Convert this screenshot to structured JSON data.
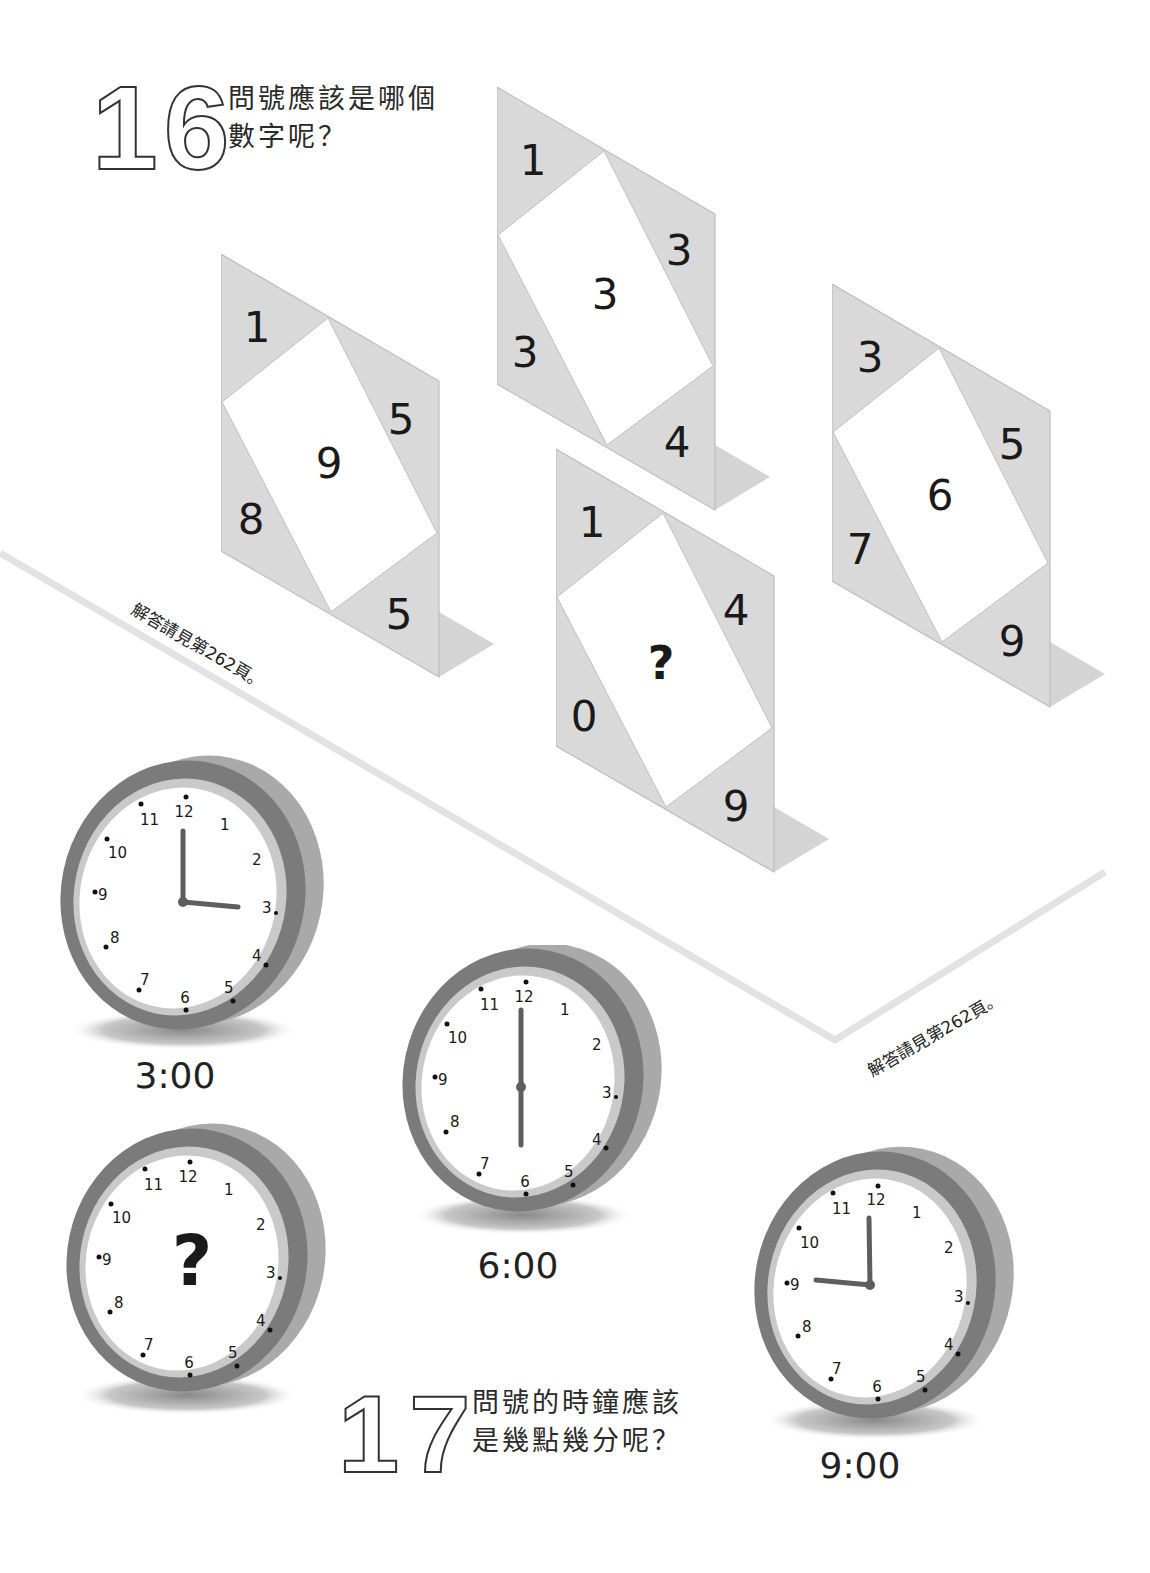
{
  "puzzle16": {
    "number": "16",
    "question_line1": "問號應該是哪個",
    "question_line2": "數字呢？",
    "cards": [
      {
        "top_left": "1",
        "right": "5",
        "left": "8",
        "bottom_right": "5",
        "center": "9"
      },
      {
        "top_left": "1",
        "right": "3",
        "left": "3",
        "bottom_right": "4",
        "center": "3"
      },
      {
        "top_left": "1",
        "right": "4",
        "left": "0",
        "bottom_right": "9",
        "center": "?"
      },
      {
        "top_left": "3",
        "right": "5",
        "left": "7",
        "bottom_right": "9",
        "center": "6"
      }
    ],
    "answer_note": "解答請見第262頁。"
  },
  "puzzle17": {
    "number": "17",
    "question_line1": "問號的時鐘應該",
    "question_line2": "是幾點幾分呢？",
    "clocks": [
      {
        "time_label": "3:00",
        "hour_hand": 3,
        "minute_hand": 0,
        "unknown": false
      },
      {
        "time_label": "6:00",
        "hour_hand": 6,
        "minute_hand": 0,
        "unknown": false
      },
      {
        "time_label": "",
        "hour_hand": null,
        "minute_hand": null,
        "unknown": true,
        "center_mark": "?"
      },
      {
        "time_label": "9:00",
        "hour_hand": 9,
        "minute_hand": 0,
        "unknown": false
      }
    ],
    "dial_numbers": [
      "12",
      "1",
      "2",
      "3",
      "4",
      "5",
      "6",
      "7",
      "8",
      "9",
      "10",
      "11"
    ],
    "answer_note": "解答請見第262頁。"
  },
  "colors": {
    "card_gray": "#d9d9d9",
    "card_edge": "#b5b5b5",
    "floor_shadow": "#d2d2d2",
    "clock_rim_dark": "#7a7a7a",
    "clock_rim_side": "#a8a8a8",
    "clock_inner_ring": "#c8c8c8",
    "divider": "#e0e0e0"
  }
}
